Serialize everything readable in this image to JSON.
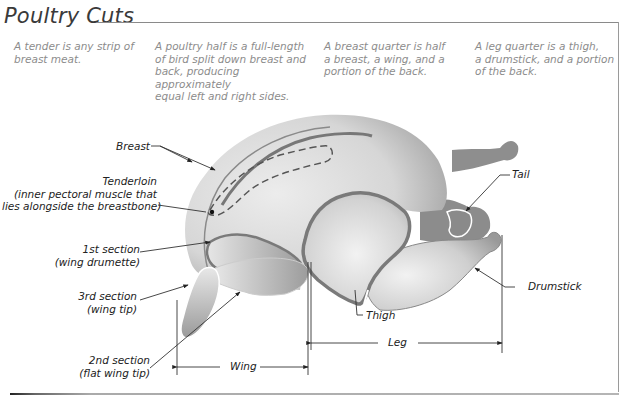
{
  "title": "Poultry Cuts",
  "notes": [
    {
      "id": "tender",
      "lines": [
        "A tender is any strip of",
        "breast meat."
      ]
    },
    {
      "id": "half",
      "lines": [
        "A poultry half is a full-length",
        "of bird split down breast and",
        "back, producing approximately",
        "equal left and right sides."
      ]
    },
    {
      "id": "breast-quarter",
      "lines": [
        "A breast quarter is half",
        "a breast, a wing, and a",
        "portion of the back."
      ]
    },
    {
      "id": "leg-quarter",
      "lines": [
        "A leg quarter is a thigh,",
        "a drumstick, and a portion",
        "of the back."
      ]
    }
  ],
  "labels": {
    "breast": "Breast",
    "tenderloin": [
      "Tenderloin",
      "(inner pectoral muscle that",
      "lies alongside the breastbone)"
    ],
    "first_section": [
      "1st section",
      "(wing drumette)"
    ],
    "third_section": [
      "3rd section",
      "(wing tip)"
    ],
    "second_section": [
      "2nd section",
      "(flat wing tip)"
    ],
    "tail": "Tail",
    "drumstick": "Drumstick",
    "thigh": "Thigh",
    "wing_span": "Wing",
    "leg_span": "Leg"
  },
  "colors": {
    "skin_light": "#e4e4e4",
    "skin_mid": "#bdbdbd",
    "skin_dark": "#8e8e8e",
    "outline": "#7a7a7a",
    "text": "#222222",
    "note_text": "#8c8c8c"
  }
}
